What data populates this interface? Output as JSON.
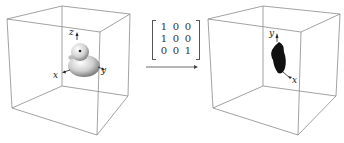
{
  "figure": {
    "left_panel": {
      "axes": {
        "x": "x",
        "y": "y",
        "z": "z"
      },
      "object": "duck-3d-model"
    },
    "transform": {
      "matrix": [
        [
          "1",
          "0",
          "0"
        ],
        [
          "1",
          "0",
          "0"
        ],
        [
          "0",
          "0",
          "1"
        ]
      ],
      "arrow": "right-arrow"
    },
    "right_panel": {
      "axes": {
        "x": "x",
        "y": "y"
      },
      "object": "projected-duck-silhouette"
    },
    "colors": {
      "cube_edge": "#8a8a8a",
      "duck_light": "#e6e6e6",
      "duck_shadow": "#7a7a7a",
      "silhouette": "#111111"
    }
  }
}
